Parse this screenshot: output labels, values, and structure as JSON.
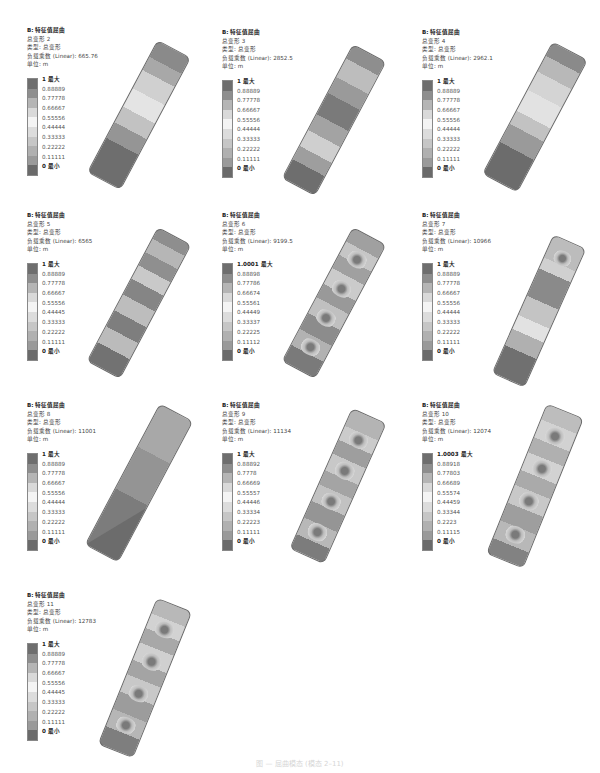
{
  "figure": {
    "header_title": "B: 特征值屈曲",
    "type_label": "类型: 总变形",
    "unit_label": "单位: m",
    "caption": "图 — 屈曲模态 (模态 2–11)",
    "max_suffix": "最大",
    "min_suffix": "最小",
    "band_colors": [
      "#6e6e6e",
      "#8e8e8e",
      "#b5b5b5",
      "#d9d9d9",
      "#f4f4f4",
      "#dcdcdc",
      "#c6c6c6",
      "#b0b0b0",
      "#9a9a9a",
      "#6a6a6a"
    ]
  },
  "panels": [
    {
      "mode": "总变形 2",
      "factor": "负载乘数 (Linear): 665.76",
      "legend": [
        "1 最大",
        "0.88889",
        "0.77778",
        "0.66667",
        "0.55556",
        "0.44444",
        "0.33333",
        "0.22222",
        "0.11111",
        "0 最小"
      ]
    },
    {
      "mode": "总变形 3",
      "factor": "负载乘数 (Linear): 2852.5",
      "legend": [
        "1 最大",
        "0.88889",
        "0.77778",
        "0.66667",
        "0.55556",
        "0.44444",
        "0.33333",
        "0.22222",
        "0.11111",
        "0 最小"
      ]
    },
    {
      "mode": "总变形 4",
      "factor": "负载乘数 (Linear): 2962.1",
      "legend": [
        "1 最大",
        "0.88889",
        "0.77778",
        "0.66667",
        "0.55556",
        "0.44444",
        "0.33333",
        "0.22222",
        "0.11111",
        "0 最小"
      ]
    },
    {
      "mode": "总变形 5",
      "factor": "负载乘数 (Linear): 6565",
      "legend": [
        "1 最大",
        "0.88889",
        "0.77778",
        "0.66667",
        "0.55556",
        "0.44445",
        "0.33333",
        "0.22222",
        "0.11111",
        "0 最小"
      ]
    },
    {
      "mode": "总变形 6",
      "factor": "负载乘数 (Linear): 9199.5",
      "legend": [
        "1.0001 最大",
        "0.88898",
        "0.77786",
        "0.66674",
        "0.55561",
        "0.44449",
        "0.33337",
        "0.22225",
        "0.11112",
        "0 最小"
      ]
    },
    {
      "mode": "总变形 7",
      "factor": "负载乘数 (Linear): 10966",
      "legend": [
        "1 最大",
        "0.88889",
        "0.77778",
        "0.66667",
        "0.55556",
        "0.44444",
        "0.33333",
        "0.22222",
        "0.11111",
        "0 最小"
      ]
    },
    {
      "mode": "总变形 8",
      "factor": "负载乘数 (Linear): 11001",
      "legend": [
        "1 最大",
        "0.88889",
        "0.77778",
        "0.66667",
        "0.55556",
        "0.44444",
        "0.33333",
        "0.22222",
        "0.11111",
        "0 最小"
      ]
    },
    {
      "mode": "总变形 9",
      "factor": "负载乘数 (Linear): 11134",
      "legend": [
        "1 最大",
        "0.88892",
        "0.7778",
        "0.66669",
        "0.55557",
        "0.44446",
        "0.33334",
        "0.22223",
        "0.11111",
        "0 最小"
      ]
    },
    {
      "mode": "总变形 10",
      "factor": "负载乘数 (Linear): 12074",
      "legend": [
        "1.0003 最大",
        "0.88918",
        "0.77803",
        "0.66689",
        "0.55574",
        "0.44459",
        "0.33344",
        "0.2223",
        "0.11115",
        "0 最小"
      ]
    },
    {
      "mode": "总变形 11",
      "factor": "负载乘数 (Linear): 12783",
      "legend": [
        "1 最大",
        "0.88889",
        "0.77778",
        "0.66667",
        "0.55556",
        "0.44445",
        "0.33333",
        "0.22222",
        "0.11111",
        "0 最小"
      ]
    }
  ]
}
